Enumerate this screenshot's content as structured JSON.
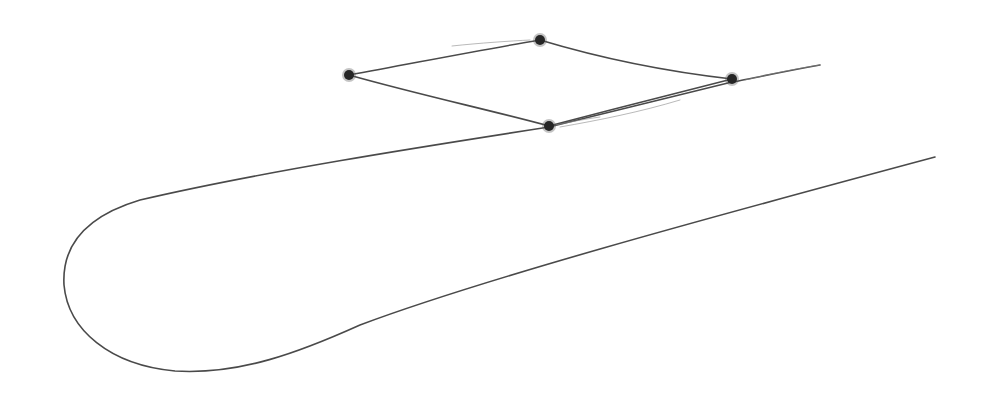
{
  "diagram": {
    "colors": {
      "background": "#ffffff",
      "stroke": "#4a4a4a",
      "vertex": "#262626"
    },
    "quadrilateral": {
      "vertices": [
        {
          "name": "left",
          "x": 349,
          "y": 75
        },
        {
          "name": "top",
          "x": 540,
          "y": 40
        },
        {
          "name": "right",
          "x": 732,
          "y": 79
        },
        {
          "name": "bottom",
          "x": 549,
          "y": 126
        }
      ]
    },
    "outline": {
      "upper_edge_end": {
        "x": 820,
        "y": 65
      },
      "lower_edge_end": {
        "x": 935,
        "y": 157
      },
      "loop_leftmost": {
        "x": 63,
        "y": 275
      },
      "loop_bottom": {
        "x": 175,
        "y": 372
      }
    }
  }
}
